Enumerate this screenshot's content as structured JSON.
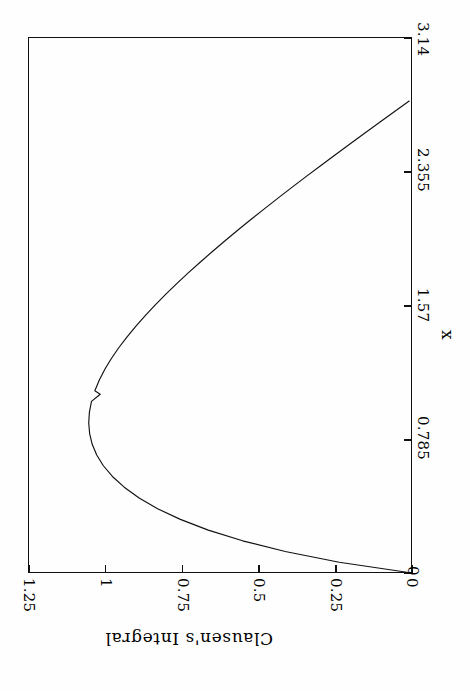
{
  "figure": {
    "background_color": "#fefefe",
    "foreground_color": "#111111",
    "orientation": "landscape-rotated-90"
  },
  "chart_data": {
    "type": "line",
    "title": "",
    "subtitle": "",
    "xlabel": "x",
    "ylabel": "Clausen's Integral",
    "xlim": [
      0,
      3.14
    ],
    "ylim": [
      0,
      1.25
    ],
    "xticks": [
      "0",
      "0.785",
      "1.57",
      "2.355",
      "3.14"
    ],
    "xtick_values": [
      0,
      0.785,
      1.57,
      2.355,
      3.14
    ],
    "yticks": [
      "0",
      "0.25",
      "0.5",
      "0.75",
      "1",
      "1.25"
    ],
    "ytick_values": [
      0,
      0.25,
      0.5,
      0.75,
      1,
      1.25
    ],
    "grid": false,
    "legend": "none",
    "line_color": "#111111",
    "series": [
      {
        "name": "Clausen's Integral",
        "x": [
          0.0,
          0.0628,
          0.1257,
          0.1885,
          0.2513,
          0.3142,
          0.377,
          0.4398,
          0.5027,
          0.5655,
          0.6283,
          0.6912,
          0.754,
          0.8168,
          0.8796,
          0.9425,
          1.0053,
          1.0472,
          1.0681,
          1.131,
          1.1938,
          1.2566,
          1.3195,
          1.3823,
          1.4451,
          1.508,
          1.5708,
          1.6336,
          1.6965,
          1.7593,
          1.8221,
          1.885,
          1.9478,
          2.0106,
          2.0735,
          2.1363,
          2.1991,
          2.2619,
          2.3248,
          2.3876,
          2.4504,
          2.5133,
          2.5761,
          2.6389,
          2.7018,
          2.7646,
          2.8274,
          2.8903,
          2.9531,
          3.0159,
          3.0788,
          3.1416
        ],
        "y": [
          0.0,
          0.2368,
          0.4127,
          0.5515,
          0.6632,
          0.754,
          0.8281,
          0.8883,
          0.9368,
          0.9752,
          1.0047,
          1.0263,
          1.041,
          1.0494,
          1.0523,
          1.0501,
          1.0433,
          1.015,
          1.0324,
          1.0178,
          0.9998,
          0.9786,
          0.9546,
          0.9281,
          0.8993,
          0.8684,
          0.8356,
          0.8011,
          0.765,
          0.7275,
          0.6887,
          0.6487,
          0.6076,
          0.5655,
          0.5225,
          0.4787,
          0.4341,
          0.3888,
          0.3429,
          0.2965,
          0.2495,
          0.2021,
          0.1543,
          0.1062,
          0.0578,
          0.0092,
          -0.0396,
          -0.0886,
          -0.1378,
          -0.1871,
          -0.2365,
          -0.286
        ],
        "peak_x": 1.0472,
        "peak_y": 1.0523
      }
    ],
    "annotations": []
  },
  "axes": {
    "x_axis": {
      "label": "x",
      "position": "right-edge-vertical",
      "ticks": [
        {
          "label": "0",
          "value": 0
        },
        {
          "label": "0.785",
          "value": 0.785
        },
        {
          "label": "1.57",
          "value": 1.57
        },
        {
          "label": "2.355",
          "value": 2.355
        },
        {
          "label": "3.14",
          "value": 3.14
        }
      ]
    },
    "y_axis": {
      "label": "Clausen's Integral",
      "position": "bottom-edge-horizontal",
      "ticks": [
        {
          "label": "1.25",
          "value": 1.25
        },
        {
          "label": "1",
          "value": 1
        },
        {
          "label": "0.75",
          "value": 0.75
        },
        {
          "label": "0.5",
          "value": 0.5
        },
        {
          "label": "0.25",
          "value": 0.25
        },
        {
          "label": "0",
          "value": 0
        }
      ]
    }
  }
}
